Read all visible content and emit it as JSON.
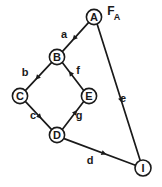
{
  "figure": {
    "width": 162,
    "height": 187,
    "background_color": "#ffffff",
    "ink_color": "#1a1a1a"
  },
  "source_label": {
    "base": "F",
    "subscript": "A",
    "full": "F_A",
    "x": 111,
    "y": 11
  },
  "nodes": [
    {
      "id": "A",
      "label": "A",
      "cx": 94,
      "cy": 17,
      "r": 7.6
    },
    {
      "id": "B",
      "label": "B",
      "cx": 57,
      "cy": 57,
      "r": 7.6
    },
    {
      "id": "C",
      "label": "C",
      "cx": 20,
      "cy": 96,
      "r": 7.6
    },
    {
      "id": "E",
      "label": "E",
      "cx": 89,
      "cy": 96,
      "r": 7.6
    },
    {
      "id": "D",
      "label": "D",
      "cx": 57,
      "cy": 135,
      "r": 7.6
    },
    {
      "id": "I",
      "label": "I",
      "cx": 143,
      "cy": 168,
      "r": 8.0
    }
  ],
  "edges": [
    {
      "id": "a",
      "label": "a",
      "from": "A",
      "to": "B",
      "x1": 88.7,
      "y1": 22.4,
      "x2": 62.3,
      "y2": 51.6,
      "arrow_t": 0.55,
      "label_x": 64,
      "label_y": 34
    },
    {
      "id": "b",
      "label": "b",
      "from": "B",
      "to": "C",
      "x1": 51.7,
      "y1": 62.4,
      "x2": 25.3,
      "y2": 90.6,
      "arrow_t": 0.55,
      "label_x": 25,
      "label_y": 72
    },
    {
      "id": "f",
      "label": "f",
      "from": "E",
      "to": "B",
      "x1": 83.7,
      "y1": 90.6,
      "x2": 62.3,
      "y2": 62.4,
      "arrow_t": 0.62,
      "label_x": 78,
      "label_y": 70
    },
    {
      "id": "c",
      "label": "c",
      "from": "C",
      "to": "D",
      "x1": 25.3,
      "y1": 101.4,
      "x2": 51.7,
      "y2": 129.6,
      "arrow_t": 0.55,
      "label_x": 33,
      "label_y": 115
    },
    {
      "id": "g",
      "label": "g",
      "from": "D",
      "to": "E",
      "x1": 62.3,
      "y1": 129.6,
      "x2": 83.7,
      "y2": 101.4,
      "arrow_t": 0.62,
      "label_x": 79,
      "label_y": 115
    },
    {
      "id": "e",
      "label": "e",
      "from": "A",
      "to": "I",
      "x1": 97.2,
      "y1": 24.2,
      "x2": 140.2,
      "y2": 160.4,
      "arrow_t": 0.56,
      "label_x": 123,
      "label_y": 98
    },
    {
      "id": "d",
      "label": "d",
      "from": "D",
      "to": "I",
      "x1": 64.1,
      "y1": 138.6,
      "x2": 135.4,
      "y2": 165.2,
      "arrow_t": 0.56,
      "label_x": 90,
      "label_y": 160
    }
  ]
}
